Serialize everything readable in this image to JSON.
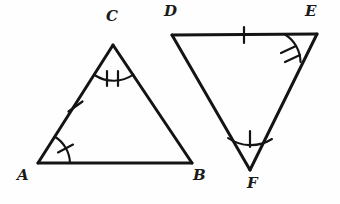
{
  "figure": {
    "background_color": "#fefefe",
    "stroke_color": "#141414",
    "label_color": "#1a1a1a",
    "width": 340,
    "height": 204
  },
  "triangles": [
    {
      "name": "triangle-abc",
      "vertices": [
        {
          "label": "A",
          "x": 38,
          "y": 163,
          "label_x": 17,
          "label_y": 172
        },
        {
          "label": "B",
          "x": 192,
          "y": 163,
          "label_x": 192,
          "label_y": 172
        },
        {
          "label": "C",
          "x": 113,
          "y": 45,
          "label_x": 105,
          "label_y": 10
        }
      ],
      "sides": [
        {
          "name": "side-ab",
          "from": "A",
          "to": "B",
          "ticks": 0
        },
        {
          "name": "side-bc",
          "from": "B",
          "to": "C",
          "ticks": 0
        },
        {
          "name": "side-ac",
          "from": "A",
          "to": "C",
          "ticks": 1
        }
      ],
      "angles": [
        {
          "name": "angle-a",
          "vertex": "A",
          "arcs": 1,
          "ticks": 1
        },
        {
          "name": "angle-b",
          "vertex": "B",
          "arcs": 0,
          "ticks": 0
        },
        {
          "name": "angle-c",
          "vertex": "C",
          "arcs": 1,
          "ticks": 2
        }
      ]
    },
    {
      "name": "triangle-def",
      "vertices": [
        {
          "label": "D",
          "x": 172,
          "y": 35,
          "label_x": 165,
          "label_y": 7
        },
        {
          "label": "E",
          "x": 317,
          "y": 34,
          "label_x": 305,
          "label_y": 7
        },
        {
          "label": "F",
          "x": 250,
          "y": 170,
          "label_x": 248,
          "label_y": 180
        }
      ],
      "sides": [
        {
          "name": "side-de",
          "from": "D",
          "to": "E",
          "ticks": 1
        },
        {
          "name": "side-ef",
          "from": "E",
          "to": "F",
          "ticks": 0
        },
        {
          "name": "side-df",
          "from": "D",
          "to": "F",
          "ticks": 0
        }
      ],
      "angles": [
        {
          "name": "angle-d",
          "vertex": "D",
          "arcs": 0,
          "ticks": 0
        },
        {
          "name": "angle-e",
          "vertex": "E",
          "arcs": 1,
          "ticks": 2
        },
        {
          "name": "angle-f",
          "vertex": "F",
          "arcs": 1,
          "ticks": 1
        }
      ]
    }
  ],
  "labels": {
    "a": "A",
    "b": "B",
    "c": "C",
    "d": "D",
    "e": "E",
    "f": "F"
  }
}
